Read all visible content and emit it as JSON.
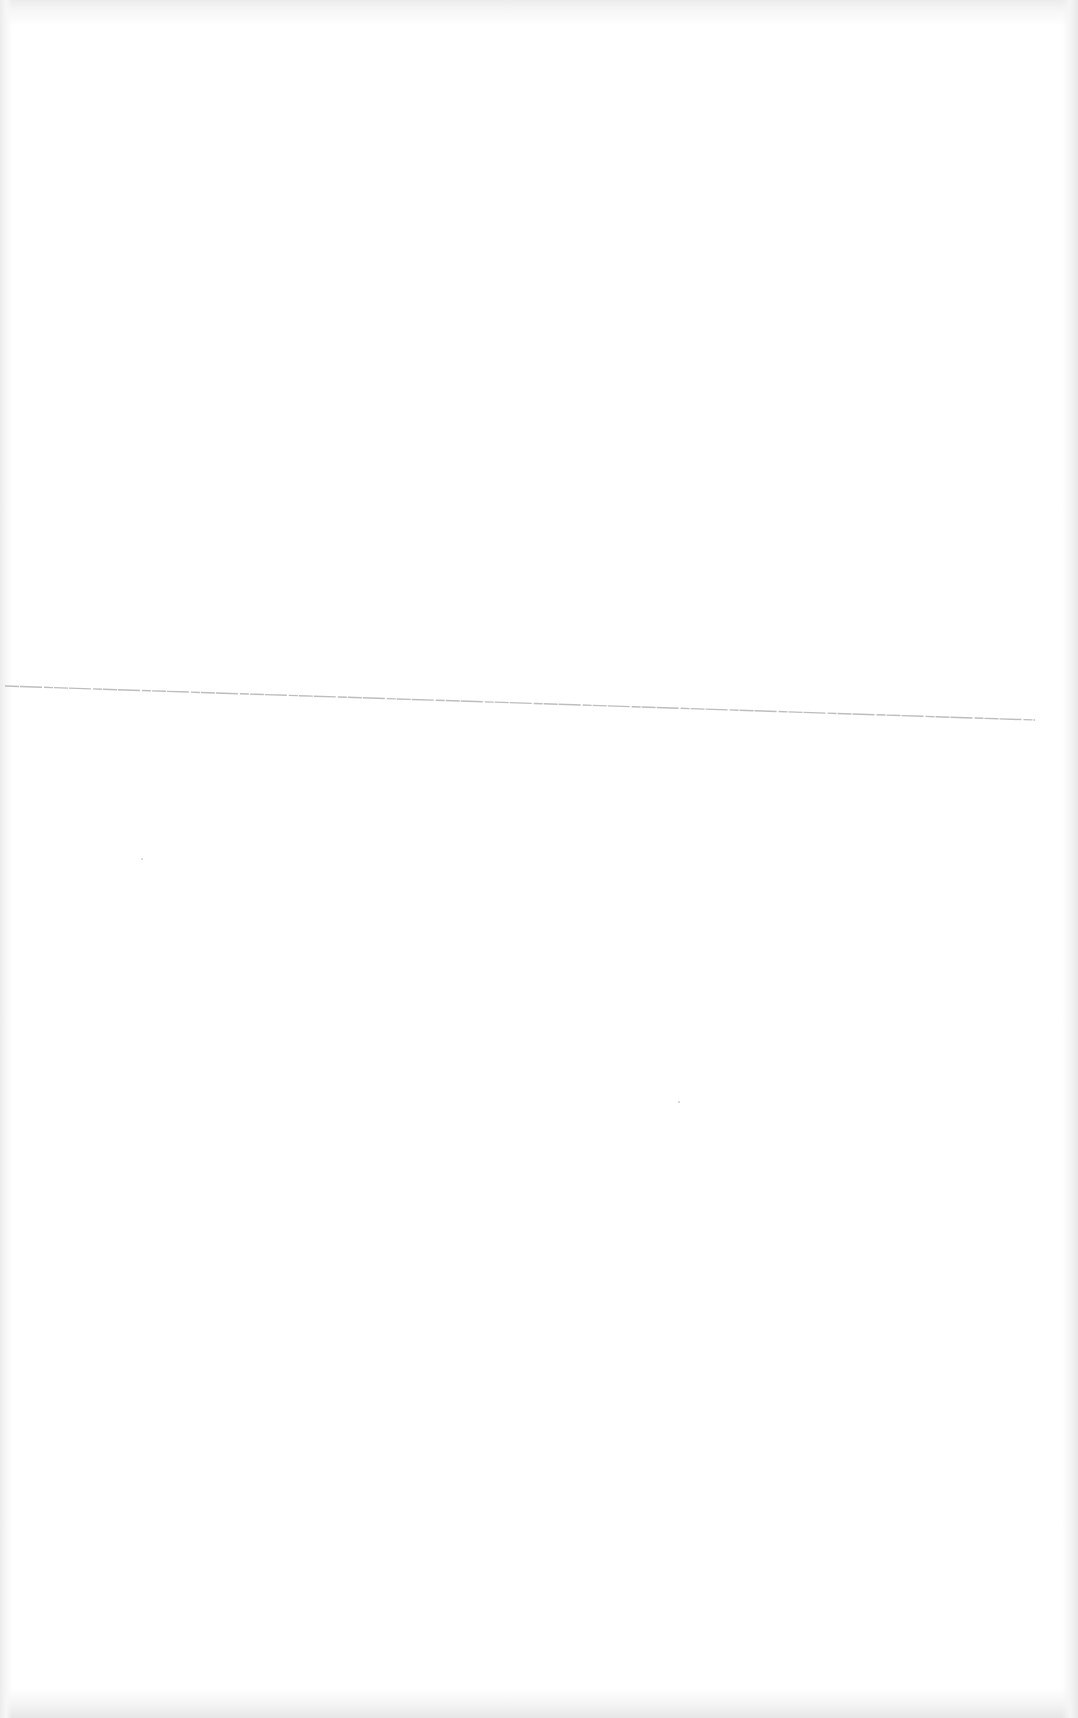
{
  "document": {
    "page_type": "blank scanned page",
    "text_blocks": [],
    "rule": {
      "color": "#bdbdbd",
      "x1": 5,
      "y1": 686,
      "x2": 1035,
      "y2": 720
    },
    "background_color": "#ffffff"
  }
}
